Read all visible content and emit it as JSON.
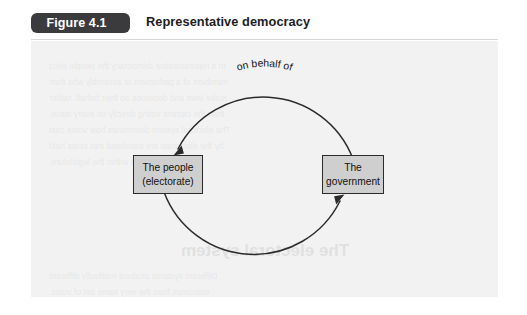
{
  "figure": {
    "badge_label": "Figure 4.1",
    "title": "Representative democracy"
  },
  "diagram": {
    "type": "cycle-diagram",
    "nodes": [
      {
        "id": "people",
        "line1": "The people",
        "line2": "(electorate)",
        "fill": "#cfcfcf",
        "border": "#2b2b2b"
      },
      {
        "id": "government",
        "line1": "The",
        "line2": "government",
        "fill": "#cfcfcf",
        "border": "#2b2b2b"
      }
    ],
    "arcs": [
      {
        "id": "top-arc",
        "from": "government",
        "to": "people",
        "label_line1": "Make laws/decisions",
        "label_line2": "on behalf of"
      },
      {
        "id": "bottom-arc",
        "from": "people",
        "to": "government",
        "label_line1": "Choose members of"
      }
    ],
    "panel_background": "#f2f2f2",
    "stroke_color": "#2b2b2b"
  },
  "bleedthrough": {
    "heading": "The electoral system",
    "lines": [
      "in a representative democracy the people elect",
      "members of a parliament or assembly who then",
      "make laws and decisions on their behalf, rather",
      "than the citizens voting directly on every issue.",
      "The electoral system determines how votes cast",
      "by the electorate are translated into seats held",
      "by political parties within the legislature.",
      "Different systems produce markedly different",
      "outcomes from the very same set of votes."
    ]
  }
}
